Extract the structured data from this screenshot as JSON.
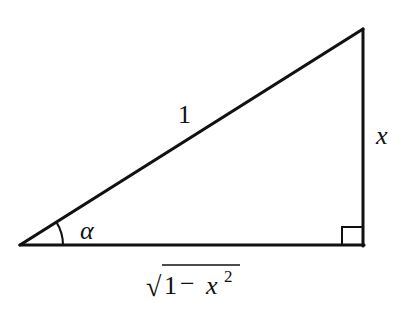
{
  "diagram": {
    "type": "right-triangle",
    "stroke_color": "#111111",
    "background": "#ffffff",
    "vertices": {
      "angle_vertex": [
        20,
        245
      ],
      "right_angle_vertex": [
        363,
        245
      ],
      "top_vertex": [
        363,
        29
      ]
    },
    "labels": {
      "hypotenuse": "1",
      "opposite": "x",
      "adjacent_radical_sign": "√",
      "adjacent_body": "1 − x",
      "adjacent_exponent": "2",
      "angle": "α"
    },
    "annotations": {
      "angle_arc": "arc marking angle α at left vertex",
      "right_angle_marker": "square marker at bottom-right vertex"
    }
  }
}
